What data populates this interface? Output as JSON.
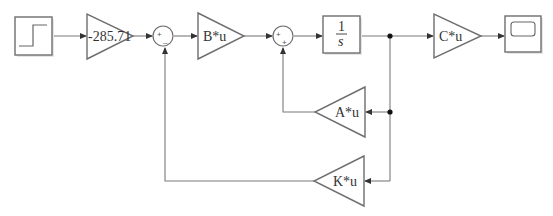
{
  "diagram": {
    "title_clipped": "",
    "blocks": {
      "step": {
        "name": "Step"
      },
      "gain_input": {
        "label": "-285.71"
      },
      "sum1": {
        "signs": [
          "+",
          "–"
        ]
      },
      "gain_b": {
        "label": "B*u"
      },
      "sum2": {
        "signs": [
          "+",
          "+"
        ]
      },
      "integrator": {
        "numerator": "1",
        "denominator": "s"
      },
      "gain_c": {
        "label": "C*u"
      },
      "scope": {
        "name": "Scope"
      },
      "gain_a": {
        "label": "A*u"
      },
      "gain_k": {
        "label": "K*u"
      }
    },
    "colors": {
      "stroke": "#6e6e6e",
      "wire": "#7a7a7a",
      "junction": "#111111",
      "background": "#ffffff"
    }
  }
}
